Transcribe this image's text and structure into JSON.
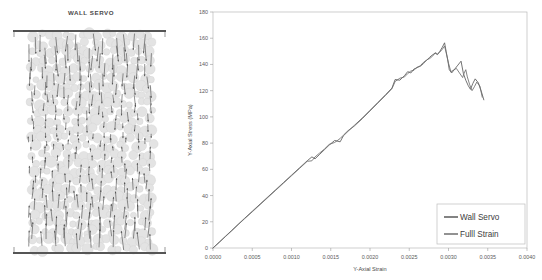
{
  "figure": {
    "left_panel": {
      "title": "WALL SERVO",
      "description_icons": {
        "top_wall": "wall-line-icon",
        "bottom_wall": "wall-line-icon",
        "particles": "particle-assembly-icon",
        "vectors": "displacement-arrow-icon"
      },
      "particle_color": "#e3e3e3",
      "particle_stroke": "#d2d2d2",
      "arrow_color": "#4c4c4c",
      "wall_color": "#555555"
    }
  },
  "chart_data": {
    "type": "line",
    "title": "",
    "xlabel": "Y-Axial Strain",
    "ylabel": "Y-Axial Stress (MPa)",
    "xlim": [
      0.0,
      0.004
    ],
    "ylim": [
      0,
      180
    ],
    "xticks": [
      0.0,
      0.0005,
      0.001,
      0.0015,
      0.002,
      0.0025,
      0.003,
      0.0035,
      0.004
    ],
    "xtick_labels": [
      "0.0000",
      "0.0005",
      "0.0010",
      "0.0015",
      "0.0020",
      "0.0025",
      "0.0030",
      "0.0035",
      "0.0040"
    ],
    "yticks": [
      0,
      20,
      40,
      60,
      80,
      100,
      120,
      140,
      160,
      180
    ],
    "ytick_labels": [
      "0",
      "20",
      "40",
      "60",
      "80",
      "100",
      "120",
      "140",
      "160",
      "180"
    ],
    "grid": false,
    "legend_position": "lower right",
    "series": [
      {
        "name": "Wall Servo",
        "color": "#5a5a5a",
        "x": [
          0.0,
          8e-05,
          0.00016,
          0.00024,
          0.00032,
          0.0004,
          0.0005,
          0.0006,
          0.0007,
          0.0008,
          0.0009,
          0.001,
          0.0011,
          0.0012,
          0.00126,
          0.0013,
          0.00136,
          0.00142,
          0.00148,
          0.00155,
          0.00162,
          0.00166,
          0.00172,
          0.0018,
          0.0019,
          0.002,
          0.0021,
          0.0022,
          0.00228,
          0.00232,
          0.00238,
          0.00244,
          0.00248,
          0.00252,
          0.00256,
          0.0026,
          0.00264,
          0.00268,
          0.00272,
          0.00276,
          0.0028,
          0.00283,
          0.00286,
          0.00289,
          0.00292,
          0.00295,
          0.00297,
          0.00299,
          0.00301,
          0.00304,
          0.00308,
          0.00312,
          0.00316,
          0.00319,
          0.00322,
          0.00325,
          0.00328,
          0.00331,
          0.00334,
          0.00338,
          0.00342,
          0.00345
        ],
        "y": [
          0.0,
          4.5,
          9.0,
          13.5,
          18.0,
          22.5,
          28.0,
          33.5,
          39.0,
          44.5,
          50.0,
          55.5,
          61.0,
          66.5,
          69.5,
          68.0,
          71.5,
          75.0,
          78.5,
          82.0,
          81.0,
          85.5,
          89.0,
          93.5,
          99.0,
          105.0,
          111.0,
          117.0,
          122.0,
          128.5,
          128.0,
          131.5,
          134.5,
          133.5,
          136.5,
          137.5,
          139.0,
          141.5,
          143.0,
          145.5,
          147.5,
          148.5,
          147.5,
          150.0,
          153.0,
          156.5,
          150.0,
          143.5,
          136.0,
          133.5,
          136.5,
          139.5,
          142.5,
          133.0,
          128.0,
          124.0,
          121.0,
          125.5,
          129.0,
          126.0,
          119.0,
          113.0
        ]
      },
      {
        "name": "Fulll Strain",
        "color": "#6e6e6e",
        "x": [
          0.0,
          8e-05,
          0.00016,
          0.00024,
          0.00032,
          0.0004,
          0.0005,
          0.0006,
          0.0007,
          0.0008,
          0.0009,
          0.001,
          0.0011,
          0.0012,
          0.00126,
          0.0013,
          0.00136,
          0.00142,
          0.00148,
          0.00155,
          0.00162,
          0.00166,
          0.00172,
          0.0018,
          0.0019,
          0.002,
          0.0021,
          0.0022,
          0.00228,
          0.00232,
          0.00238,
          0.00244,
          0.00248,
          0.00252,
          0.00256,
          0.0026,
          0.00264,
          0.00268,
          0.00272,
          0.00276,
          0.0028,
          0.00283,
          0.00286,
          0.00289,
          0.00292,
          0.00295,
          0.00297,
          0.003,
          0.00303,
          0.00306,
          0.0031,
          0.00314,
          0.00318,
          0.0032,
          0.00322,
          0.00324,
          0.00327,
          0.0033,
          0.00333,
          0.00336,
          0.0034,
          0.00343
        ],
        "y": [
          0.0,
          4.3,
          8.8,
          13.2,
          17.8,
          22.2,
          27.6,
          33.1,
          38.6,
          44.1,
          49.6,
          55.1,
          60.6,
          66.1,
          66.5,
          69.5,
          72.5,
          75.5,
          79.0,
          80.5,
          83.5,
          86.0,
          89.5,
          93.0,
          98.5,
          104.5,
          110.5,
          116.5,
          121.5,
          127.0,
          129.5,
          130.5,
          133.0,
          135.0,
          135.5,
          138.0,
          138.5,
          140.5,
          143.5,
          144.5,
          146.5,
          149.0,
          148.0,
          149.5,
          151.5,
          154.0,
          149.0,
          141.0,
          134.5,
          135.5,
          137.0,
          133.5,
          130.0,
          133.5,
          136.0,
          130.5,
          124.5,
          120.0,
          123.0,
          126.5,
          123.5,
          115.0
        ]
      }
    ]
  }
}
